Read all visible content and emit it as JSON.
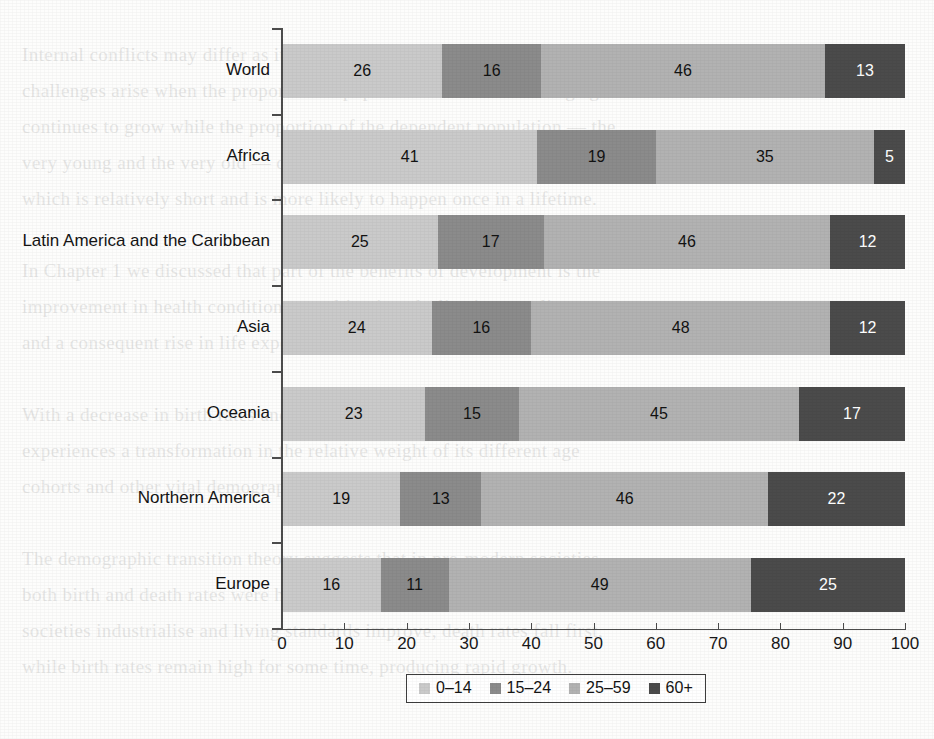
{
  "chart_data": {
    "type": "bar",
    "orientation": "horizontal",
    "stacked": true,
    "normalized_percent": true,
    "title": "",
    "subtitle": "",
    "xlabel": "",
    "ylabel": "",
    "xlim": [
      0,
      100
    ],
    "xticks": [
      0,
      10,
      20,
      30,
      40,
      50,
      60,
      70,
      80,
      90,
      100
    ],
    "grid": false,
    "legend_position": "bottom-center",
    "categories": [
      "World",
      "Africa",
      "Latin America and the Caribbean",
      "Asia",
      "Oceania",
      "Northern America",
      "Europe"
    ],
    "series": [
      {
        "name": "0–14",
        "color": "#cacaca",
        "values": [
          26,
          41,
          25,
          24,
          23,
          19,
          16
        ]
      },
      {
        "name": "15–24",
        "color": "#8b8b8b",
        "values": [
          16,
          19,
          17,
          16,
          15,
          13,
          11
        ]
      },
      {
        "name": "25–59",
        "color": "#b2b2b2",
        "values": [
          46,
          35,
          46,
          48,
          45,
          46,
          49
        ]
      },
      {
        "name": "60+",
        "color": "#4b4b4b",
        "values": [
          13,
          5,
          12,
          12,
          17,
          22,
          25
        ]
      }
    ]
  },
  "legend": {
    "items": [
      {
        "label": "0–14"
      },
      {
        "label": "15–24"
      },
      {
        "label": "25–59"
      },
      {
        "label": "60+"
      }
    ]
  },
  "background_text": {
    "lines": [
      "",
      "Internal conflicts may differ as it moves through its demographic transition.",
      "challenges arise when the proportion of population that is of working age",
      "continues to grow while the proportion of the dependent population — the",
      "very young and the very old — declines. This is the demographic dividend,",
      "which is relatively short and is more likely to happen once in a lifetime.",
      "",
      "In Chapter 1 we discussed that part of the benefits of development is the",
      "improvement in health conditions, resulting in a decline in mortality rates",
      "and a consequent rise in life expectancy at birth.",
      "",
      "With a decrease in birth rates and an increase in survival rates, a country",
      "experiences a transformation in the relative weight of its different age",
      "cohorts and other vital demographic features.",
      "",
      "The demographic transition theory suggests that in pre-modern societies,",
      "both birth and death rates were high, keeping population growth low. As",
      "societies industrialise and living standards improve, death rates fall first,",
      "while birth rates remain high for some time, producing rapid growth."
    ]
  }
}
